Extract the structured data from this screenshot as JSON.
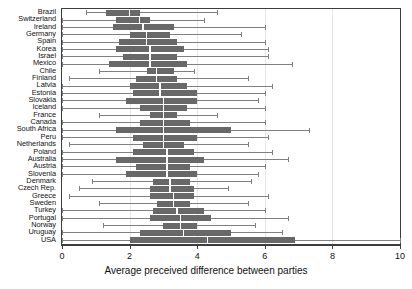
{
  "chart_data": {
    "type": "boxplot",
    "title": "",
    "xlabel": "Average preceived difference between parties",
    "ylabel": "",
    "xlim": [
      0,
      10
    ],
    "xticks": [
      0,
      2,
      4,
      6,
      8,
      10
    ],
    "xticklabels": [
      "0",
      "2",
      "4",
      "6",
      "8",
      "10"
    ],
    "grid": false,
    "orientation": "horizontal",
    "box_color": "#686868",
    "whisker_color": "#808080",
    "median_color": "#ffffff",
    "categories": [
      "Brazil",
      "Switzerland",
      "Ireland",
      "Germany",
      "Spain",
      "Korea",
      "Israel",
      "Mexico",
      "Chile",
      "Finland",
      "Latvia",
      "Estonia",
      "Slovakia",
      "Iceland",
      "France",
      "Canada",
      "South Africa",
      "Peru",
      "Netherlands",
      "Poland",
      "Australia",
      "Austria",
      "Slovenia",
      "Denmark",
      "Czech Rep.",
      "Greece",
      "Sweden",
      "Turkey",
      "Portugal",
      "Norway",
      "Uruguay",
      "USA"
    ],
    "boxes": [
      {
        "label": "Brazil",
        "whisker_low": 0.7,
        "q1": 1.3,
        "median": 2.0,
        "q3": 2.3,
        "whisker_high": 4.6
      },
      {
        "label": "Switzerland",
        "whisker_low": 0.0,
        "q1": 1.6,
        "median": 2.3,
        "q3": 2.6,
        "whisker_high": 4.2
      },
      {
        "label": "Ireland",
        "whisker_low": 0.0,
        "q1": 1.5,
        "median": 2.4,
        "q3": 3.3,
        "whisker_high": 6.0
      },
      {
        "label": "Germany",
        "whisker_low": 0.0,
        "q1": 2.0,
        "median": 2.5,
        "q3": 3.2,
        "whisker_high": 5.3
      },
      {
        "label": "Spain",
        "whisker_low": 0.0,
        "q1": 1.7,
        "median": 2.5,
        "q3": 3.4,
        "whisker_high": 6.0
      },
      {
        "label": "Korea",
        "whisker_low": 0.0,
        "q1": 1.6,
        "median": 2.6,
        "q3": 3.6,
        "whisker_high": 6.1
      },
      {
        "label": "Israel",
        "whisker_low": 0.0,
        "q1": 1.8,
        "median": 2.6,
        "q3": 3.4,
        "whisker_high": 6.1
      },
      {
        "label": "Mexico",
        "whisker_low": 0.0,
        "q1": 1.4,
        "median": 2.6,
        "q3": 3.7,
        "whisker_high": 6.8
      },
      {
        "label": "Chile",
        "whisker_low": 1.1,
        "q1": 2.5,
        "median": 2.8,
        "q3": 3.3,
        "whisker_high": 3.9
      },
      {
        "label": "Finland",
        "whisker_low": 0.2,
        "q1": 2.2,
        "median": 2.8,
        "q3": 3.4,
        "whisker_high": 5.5
      },
      {
        "label": "Latvia",
        "whisker_low": 0.0,
        "q1": 2.0,
        "median": 2.9,
        "q3": 3.7,
        "whisker_high": 6.2
      },
      {
        "label": "Estonia",
        "whisker_low": 0.0,
        "q1": 2.1,
        "median": 2.9,
        "q3": 4.0,
        "whisker_high": 6.0
      },
      {
        "label": "Slovakia",
        "whisker_low": 0.0,
        "q1": 1.9,
        "median": 3.0,
        "q3": 4.0,
        "whisker_high": 5.8
      },
      {
        "label": "Iceland",
        "whisker_low": 0.0,
        "q1": 2.3,
        "median": 3.0,
        "q3": 3.7,
        "whisker_high": 6.0
      },
      {
        "label": "France",
        "whisker_low": 1.1,
        "q1": 2.6,
        "median": 3.0,
        "q3": 3.4,
        "whisker_high": 4.6
      },
      {
        "label": "Canada",
        "whisker_low": 0.0,
        "q1": 2.3,
        "median": 3.0,
        "q3": 3.8,
        "whisker_high": 6.0
      },
      {
        "label": "South Africa",
        "whisker_low": 0.0,
        "q1": 1.6,
        "median": 3.0,
        "q3": 5.0,
        "whisker_high": 7.3
      },
      {
        "label": "Peru",
        "whisker_low": 0.0,
        "q1": 2.1,
        "median": 3.0,
        "q3": 4.0,
        "whisker_high": 6.1
      },
      {
        "label": "Netherlands",
        "whisker_low": 0.2,
        "q1": 2.4,
        "median": 3.0,
        "q3": 3.6,
        "whisker_high": 5.5
      },
      {
        "label": "Poland",
        "whisker_low": 0.0,
        "q1": 2.1,
        "median": 3.1,
        "q3": 3.9,
        "whisker_high": 6.2
      },
      {
        "label": "Australia",
        "whisker_low": 0.0,
        "q1": 1.6,
        "median": 3.1,
        "q3": 4.2,
        "whisker_high": 6.7
      },
      {
        "label": "Austria",
        "whisker_low": 0.0,
        "q1": 2.2,
        "median": 3.1,
        "q3": 3.8,
        "whisker_high": 6.0
      },
      {
        "label": "Slovenia",
        "whisker_low": 0.0,
        "q1": 1.9,
        "median": 3.1,
        "q3": 4.0,
        "whisker_high": 5.8
      },
      {
        "label": "Denmark",
        "whisker_low": 0.9,
        "q1": 2.7,
        "median": 3.2,
        "q3": 3.8,
        "whisker_high": 5.6
      },
      {
        "label": "Czech Rep.",
        "whisker_low": 0.5,
        "q1": 2.6,
        "median": 3.2,
        "q3": 3.9,
        "whisker_high": 4.9
      },
      {
        "label": "Greece",
        "whisker_low": 0.2,
        "q1": 2.6,
        "median": 3.3,
        "q3": 3.9,
        "whisker_high": 6.1
      },
      {
        "label": "Sweden",
        "whisker_low": 1.1,
        "q1": 2.8,
        "median": 3.3,
        "q3": 3.8,
        "whisker_high": 5.5
      },
      {
        "label": "Turkey",
        "whisker_low": 0.0,
        "q1": 2.7,
        "median": 3.4,
        "q3": 4.2,
        "whisker_high": 6.0
      },
      {
        "label": "Portugal",
        "whisker_low": 0.0,
        "q1": 2.6,
        "median": 3.5,
        "q3": 4.4,
        "whisker_high": 6.7
      },
      {
        "label": "Norway",
        "whisker_low": 1.2,
        "q1": 3.0,
        "median": 3.5,
        "q3": 4.0,
        "whisker_high": 5.7
      },
      {
        "label": "Uruguay",
        "whisker_low": 0.0,
        "q1": 2.3,
        "median": 3.6,
        "q3": 5.0,
        "whisker_high": 6.5
      },
      {
        "label": "USA",
        "whisker_low": 0.0,
        "q1": 2.0,
        "median": 4.3,
        "q3": 6.9,
        "whisker_high": 10.0
      }
    ]
  }
}
